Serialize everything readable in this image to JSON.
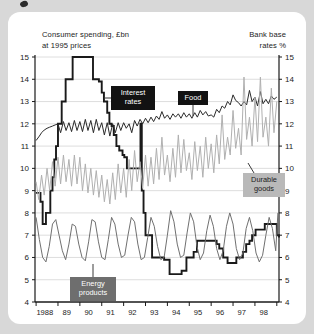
{
  "card": {
    "background_color": "#ffffff",
    "page_background_color": "#d8d8d8"
  },
  "axis_titles": {
    "left": "Consumer spending, £bn\nat 1995 prices",
    "right": "Bank base\nrates %"
  },
  "callouts": [
    {
      "name": "interest-rates",
      "line1": "Interest",
      "line2": "rates",
      "style": "dark"
    },
    {
      "name": "food",
      "line1": "Food",
      "line2": "",
      "style": "dark"
    },
    {
      "name": "durable-goods",
      "line1": "Durable",
      "line2": "goods",
      "style": "light"
    },
    {
      "name": "energy-products",
      "line1": "Energy",
      "line2": "products",
      "style": "mid"
    }
  ],
  "chart_data": {
    "type": "line",
    "title": "",
    "subtitle": "",
    "xlabel": "",
    "ylabel": "Consumer spending, £bn at 1995 prices",
    "ylabel_right": "Bank base rates %",
    "grid": true,
    "legend_position": "inline-callouts",
    "xlim": [
      1987.7,
      1998.85
    ],
    "ylim": [
      4,
      15
    ],
    "y_ticks": [
      4,
      5,
      6,
      7,
      8,
      9,
      10,
      11,
      12,
      13,
      14,
      15
    ],
    "y_ticks_right": [
      4,
      5,
      6,
      7,
      8,
      9,
      10,
      11,
      12,
      13,
      14,
      15
    ],
    "x_tick_labels": [
      "1988",
      "89",
      "90",
      "91",
      "92",
      "93",
      "94",
      "95",
      "96",
      "97",
      "98"
    ],
    "x_tick_values": [
      1988,
      1989,
      1990,
      1991,
      1992,
      1993,
      1994,
      1995,
      1996,
      1997,
      1998
    ],
    "series": [
      {
        "name": "Interest rates",
        "axis": "right",
        "color": "#1a1a1a",
        "width": 1.9,
        "style": "step",
        "x": [
          1987.75,
          1987.95,
          1988.05,
          1988.2,
          1988.3,
          1988.4,
          1988.5,
          1988.58,
          1988.66,
          1988.75,
          1988.83,
          1988.92,
          1989.0,
          1989.1,
          1989.35,
          1989.42,
          1989.9,
          1990.35,
          1990.62,
          1990.75,
          1990.85,
          1991.0,
          1991.1,
          1991.2,
          1991.3,
          1991.42,
          1991.55,
          1991.7,
          1991.78,
          1991.9,
          1992.15,
          1992.45,
          1992.52,
          1992.58,
          1992.66,
          1992.75,
          1992.9,
          1993.05,
          1993.3,
          1993.6,
          1993.85,
          1994.05,
          1994.15,
          1994.4,
          1994.62,
          1994.78,
          1994.95,
          1995.1,
          1995.25,
          1995.5,
          1995.75,
          1996.0,
          1996.12,
          1996.3,
          1996.5,
          1996.62,
          1996.78,
          1996.9,
          1997.05,
          1997.2,
          1997.35,
          1997.5,
          1997.62,
          1997.78,
          1998.0,
          1998.2,
          1998.45,
          1998.62,
          1998.75,
          1998.85
        ],
        "y": [
          8.9,
          8.5,
          7.5,
          8.0,
          8.0,
          9.0,
          9.6,
          10.4,
          11.0,
          12.0,
          12.0,
          13.0,
          13.0,
          14.0,
          14.0,
          15.0,
          15.0,
          14.0,
          13.9,
          13.4,
          13.0,
          12.5,
          12.0,
          11.9,
          11.5,
          11.0,
          10.8,
          10.6,
          10.5,
          10.0,
          10.0,
          10.0,
          12.0,
          9.0,
          8.0,
          7.0,
          7.0,
          6.0,
          6.0,
          5.9,
          5.25,
          5.25,
          5.25,
          5.4,
          6.0,
          6.0,
          6.25,
          6.75,
          6.75,
          6.75,
          6.75,
          6.6,
          6.4,
          6.0,
          5.75,
          5.75,
          5.75,
          6.0,
          6.0,
          6.25,
          6.6,
          6.75,
          7.0,
          7.25,
          7.25,
          7.5,
          7.5,
          7.5,
          7.0,
          6.9
        ]
      },
      {
        "name": "Food",
        "axis": "left",
        "color": "#2a2a2a",
        "width": 1.0,
        "style": "linear",
        "x": [
          1987.75,
          1987.9,
          1988.0,
          1988.12,
          1988.25,
          1988.37,
          1988.5,
          1988.62,
          1988.75,
          1988.87,
          1989.0,
          1989.12,
          1989.25,
          1989.37,
          1989.5,
          1989.62,
          1989.75,
          1989.87,
          1990.0,
          1990.12,
          1990.25,
          1990.37,
          1990.5,
          1990.62,
          1990.75,
          1990.87,
          1991.0,
          1991.12,
          1991.25,
          1991.37,
          1991.5,
          1991.62,
          1991.75,
          1991.87,
          1992.0,
          1992.12,
          1992.25,
          1992.37,
          1992.5,
          1992.62,
          1992.75,
          1992.87,
          1993.0,
          1993.12,
          1993.25,
          1993.37,
          1993.5,
          1993.62,
          1993.75,
          1993.87,
          1994.0,
          1994.12,
          1994.25,
          1994.37,
          1994.5,
          1994.62,
          1994.75,
          1994.87,
          1995.0,
          1995.12,
          1995.25,
          1995.37,
          1995.5,
          1995.62,
          1995.75,
          1995.87,
          1996.0,
          1996.12,
          1996.25,
          1996.37,
          1996.5,
          1996.62,
          1996.75,
          1996.87,
          1997.0,
          1997.12,
          1997.25,
          1997.37,
          1997.5,
          1997.62,
          1997.75,
          1997.87,
          1998.0,
          1998.12,
          1998.25,
          1998.37,
          1998.5,
          1998.62,
          1998.75
        ],
        "y": [
          11.25,
          11.45,
          11.6,
          11.72,
          11.8,
          11.85,
          11.9,
          11.95,
          12.0,
          11.6,
          12.1,
          11.7,
          12.05,
          11.65,
          12.15,
          11.7,
          12.1,
          11.65,
          12.2,
          11.7,
          12.15,
          11.6,
          12.2,
          11.7,
          12.05,
          11.5,
          12.05,
          11.45,
          12.0,
          11.6,
          12.05,
          11.7,
          12.05,
          11.8,
          12.0,
          11.6,
          12.15,
          11.9,
          12.2,
          12.0,
          12.25,
          12.05,
          12.3,
          12.1,
          12.35,
          12.2,
          12.55,
          12.25,
          12.4,
          12.2,
          12.45,
          12.3,
          12.45,
          12.25,
          12.5,
          12.3,
          12.45,
          12.25,
          12.5,
          12.3,
          12.6,
          12.4,
          12.55,
          12.35,
          12.4,
          12.3,
          12.65,
          12.5,
          12.8,
          12.7,
          13.0,
          12.85,
          13.3,
          13.05,
          12.95,
          12.8,
          13.0,
          12.85,
          13.5,
          13.0,
          13.2,
          12.8,
          13.45,
          12.9,
          13.1,
          12.9,
          13.25,
          13.1,
          13.2
        ]
      },
      {
        "name": "Durable goods",
        "axis": "left",
        "color": "#b0b0b0",
        "width": 1.0,
        "style": "linear",
        "x": [
          1987.75,
          1987.87,
          1988.0,
          1988.12,
          1988.25,
          1988.37,
          1988.5,
          1988.62,
          1988.75,
          1988.87,
          1989.0,
          1989.12,
          1989.25,
          1989.37,
          1989.5,
          1989.62,
          1989.75,
          1989.87,
          1990.0,
          1990.12,
          1990.25,
          1990.37,
          1990.5,
          1990.62,
          1990.75,
          1990.87,
          1991.0,
          1991.12,
          1991.25,
          1991.37,
          1991.5,
          1991.62,
          1991.75,
          1991.87,
          1992.0,
          1992.12,
          1992.25,
          1992.37,
          1992.5,
          1992.62,
          1992.75,
          1992.87,
          1993.0,
          1993.12,
          1993.25,
          1993.37,
          1993.5,
          1993.62,
          1993.75,
          1993.87,
          1994.0,
          1994.12,
          1994.25,
          1994.37,
          1994.5,
          1994.62,
          1994.75,
          1994.87,
          1995.0,
          1995.12,
          1995.25,
          1995.37,
          1995.5,
          1995.62,
          1995.75,
          1995.87,
          1996.0,
          1996.12,
          1996.25,
          1996.37,
          1996.5,
          1996.62,
          1996.75,
          1996.87,
          1997.0,
          1997.12,
          1997.25,
          1997.37,
          1997.5,
          1997.62,
          1997.75,
          1997.87,
          1998.0,
          1998.12,
          1998.25,
          1998.37,
          1998.5,
          1998.62,
          1998.75
        ],
        "y": [
          9.4,
          8.6,
          9.7,
          8.8,
          10.0,
          9.0,
          10.3,
          9.2,
          10.5,
          9.3,
          10.6,
          9.4,
          10.4,
          9.2,
          10.6,
          9.3,
          10.5,
          9.0,
          10.2,
          8.9,
          10.0,
          8.8,
          9.9,
          8.7,
          9.7,
          8.5,
          9.5,
          8.4,
          9.8,
          8.6,
          10.2,
          8.9,
          10.0,
          8.7,
          10.4,
          9.0,
          10.8,
          9.4,
          10.3,
          9.1,
          10.6,
          9.2,
          10.5,
          9.3,
          10.9,
          9.5,
          11.4,
          9.7,
          10.6,
          9.4,
          10.9,
          9.6,
          11.5,
          9.8,
          11.3,
          9.9,
          10.7,
          9.5,
          11.2,
          9.9,
          11.0,
          9.6,
          11.4,
          10.0,
          11.1,
          9.8,
          11.5,
          10.2,
          12.4,
          10.4,
          11.4,
          10.6,
          12.6,
          10.9,
          11.8,
          10.6,
          14.1,
          11.3,
          12.3,
          11.0,
          13.2,
          11.2,
          14.1,
          11.4,
          12.3,
          11.0,
          13.6,
          11.6,
          13.0
        ]
      },
      {
        "name": "Energy products",
        "axis": "left",
        "color": "#707070",
        "width": 1.0,
        "style": "linear",
        "x": [
          1987.75,
          1987.9,
          1988.05,
          1988.2,
          1988.35,
          1988.5,
          1988.65,
          1988.8,
          1988.95,
          1989.1,
          1989.25,
          1989.4,
          1989.55,
          1989.7,
          1989.85,
          1990.0,
          1990.15,
          1990.3,
          1990.45,
          1990.6,
          1990.75,
          1990.9,
          1991.05,
          1991.2,
          1991.35,
          1991.5,
          1991.65,
          1991.8,
          1991.95,
          1992.1,
          1992.25,
          1992.4,
          1992.55,
          1992.7,
          1992.85,
          1993.0,
          1993.15,
          1993.3,
          1993.45,
          1993.6,
          1993.75,
          1993.9,
          1994.05,
          1994.2,
          1994.35,
          1994.5,
          1994.65,
          1994.8,
          1994.95,
          1995.1,
          1995.25,
          1995.4,
          1995.55,
          1995.7,
          1995.85,
          1996.0,
          1996.15,
          1996.3,
          1996.45,
          1996.6,
          1996.75,
          1996.9,
          1997.05,
          1997.2,
          1997.35,
          1997.5,
          1997.65,
          1997.8,
          1997.95,
          1998.1,
          1998.25,
          1998.4,
          1998.55,
          1998.7,
          1998.8
        ],
        "y": [
          7.8,
          6.8,
          6.0,
          5.8,
          6.5,
          7.5,
          7.7,
          7.0,
          6.3,
          5.9,
          6.6,
          7.5,
          7.4,
          6.6,
          6.0,
          5.85,
          6.7,
          7.7,
          7.6,
          6.7,
          6.0,
          5.9,
          6.8,
          7.8,
          7.5,
          6.6,
          6.0,
          6.1,
          7.0,
          7.8,
          7.6,
          6.6,
          5.9,
          6.0,
          6.9,
          7.8,
          7.4,
          6.5,
          5.9,
          6.0,
          7.0,
          8.1,
          7.6,
          6.6,
          6.0,
          6.1,
          7.1,
          8.0,
          7.6,
          6.5,
          5.9,
          6.2,
          7.2,
          7.9,
          7.4,
          6.4,
          5.9,
          6.3,
          7.4,
          8.0,
          7.5,
          6.4,
          5.9,
          6.2,
          7.3,
          7.8,
          7.2,
          6.2,
          5.8,
          6.1,
          7.0,
          7.8,
          7.3,
          6.3,
          8.0
        ]
      }
    ]
  }
}
